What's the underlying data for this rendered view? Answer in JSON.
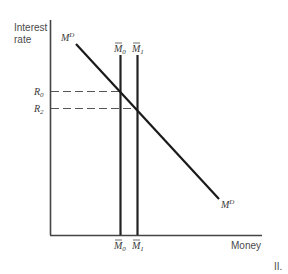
{
  "diagram": {
    "y_axis_label_line1": "Interest",
    "y_axis_label_line2": "rate",
    "x_axis_label": "Money",
    "demand_curve_label": "M",
    "demand_curve_sup": "D",
    "supply_labels": [
      {
        "base": "M",
        "sub": "0"
      },
      {
        "base": "M",
        "sub": "1"
      }
    ],
    "rate_labels": [
      {
        "base": "R",
        "sub": "0"
      },
      {
        "base": "R",
        "sub": "2"
      }
    ],
    "panel_label": "II."
  }
}
